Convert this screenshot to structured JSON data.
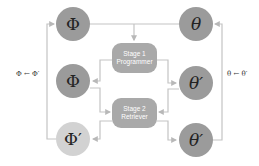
{
  "nodes": {
    "phi_top": {
      "symbol": "Φ"
    },
    "phi_mid": {
      "symbol": "Φ"
    },
    "phi_prime": {
      "symbol": "Φ′"
    },
    "theta_top": {
      "symbol": "θ"
    },
    "theta_prime_mid": {
      "symbol": "θ′"
    },
    "theta_prime_bot": {
      "symbol": "θ′"
    }
  },
  "stages": [
    {
      "line1": "Stage 1",
      "line2": "Programmer"
    },
    {
      "line1": "Stage 2",
      "line2": "Retriever"
    }
  ],
  "labels": {
    "left_update": "Φ ← Φ′",
    "right_update": "θ ← θ′"
  },
  "colors": {
    "node_dark": "#9b9b9b",
    "node_light": "#d2d2d2",
    "stage_box": "#a9a9a9",
    "line": "#c4c4c4"
  }
}
